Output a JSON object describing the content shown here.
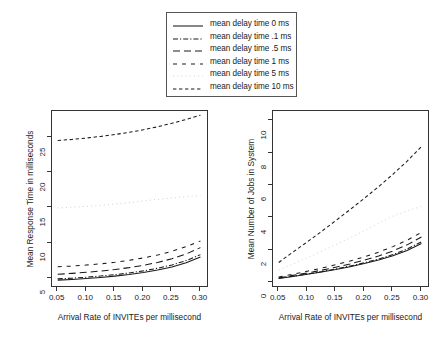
{
  "legend": {
    "position": "top-center",
    "border": "#555555",
    "entries": [
      {
        "label": "mean delay time 0 ms",
        "style": "solid",
        "dash": "none",
        "key": "legend-key-0ms"
      },
      {
        "label": "mean delay time .1 ms",
        "style": "dash-dot",
        "dash": "5,2,1.2,2",
        "key": "legend-key-0p1ms"
      },
      {
        "label": "mean delay time .5 ms",
        "style": "long-dash",
        "dash": "7,4",
        "key": "legend-key-0p5ms"
      },
      {
        "label": "mean delay time 1 ms",
        "style": "short-dash",
        "dash": "4,5",
        "key": "legend-key-1ms"
      },
      {
        "label": "mean delay time 5 ms",
        "style": "fine-dotted",
        "dash": "1,3.2",
        "key": "legend-key-5ms"
      },
      {
        "label": "mean delay time 10 ms",
        "style": "dashed",
        "dash": "3.4,2.6",
        "key": "legend-key-10ms"
      }
    ]
  },
  "chart_data": [
    {
      "id": "response-time",
      "type": "line",
      "title": "",
      "xlabel": "Arrival Rate of INVITEs per millisecond",
      "ylabel": "Mean Response Time in milliseconds",
      "xlim": [
        0.04,
        0.315
      ],
      "ylim": [
        3.6,
        28.8
      ],
      "xticks": [
        0.05,
        0.1,
        0.15,
        0.2,
        0.25,
        0.3
      ],
      "xticklabels": [
        "0.05",
        "0.10",
        "0.15",
        "0.20",
        "0.25",
        "0.30"
      ],
      "yticks": [
        5,
        10,
        15,
        20,
        25
      ],
      "yticklabels": [
        "5",
        "10",
        "15",
        "20",
        "25"
      ],
      "grid": false,
      "x": [
        0.05,
        0.075,
        0.1,
        0.125,
        0.15,
        0.175,
        0.2,
        0.225,
        0.25,
        0.275,
        0.3
      ],
      "series": [
        {
          "name": "mean delay time 0 ms",
          "style": "solid",
          "dash": "none",
          "values": [
            4.72,
            4.82,
            4.95,
            5.1,
            5.29,
            5.52,
            5.8,
            6.15,
            6.6,
            7.18,
            8.0
          ]
        },
        {
          "name": "mean delay time .1 ms",
          "style": "dash-dot",
          "dash": "5,2,1.2,2",
          "values": [
            4.9,
            5.0,
            5.14,
            5.3,
            5.5,
            5.74,
            6.04,
            6.41,
            6.88,
            7.5,
            8.35
          ]
        },
        {
          "name": "mean delay time .5 ms",
          "style": "long-dash",
          "dash": "7,4",
          "values": [
            5.55,
            5.68,
            5.83,
            6.01,
            6.23,
            6.5,
            6.83,
            7.24,
            7.76,
            8.44,
            9.35
          ]
        },
        {
          "name": "mean delay time 1 ms",
          "style": "short-dash",
          "dash": "4,5",
          "values": [
            6.62,
            6.72,
            6.86,
            7.04,
            7.26,
            7.54,
            7.88,
            8.3,
            8.83,
            9.5,
            10.3
          ]
        },
        {
          "name": "mean delay time 5 ms",
          "style": "fine-dotted",
          "dash": "1,3.2",
          "values": [
            15.0,
            15.1,
            15.22,
            15.37,
            15.55,
            15.76,
            16.0,
            16.22,
            16.42,
            16.6,
            16.78
          ]
        },
        {
          "name": "mean delay time 10 ms",
          "style": "dashed",
          "dash": "3.4,2.6",
          "values": [
            24.6,
            24.75,
            24.95,
            25.18,
            25.45,
            25.76,
            26.12,
            26.55,
            27.05,
            27.6,
            28.2
          ]
        }
      ]
    },
    {
      "id": "jobs-in-system",
      "type": "line",
      "title": "",
      "xlabel": "Arrival Rate of INVITEs per millisecond",
      "ylabel": "Mean Number of Jobs in System",
      "xlim": [
        0.04,
        0.315
      ],
      "ylim": [
        -0.35,
        10.6
      ],
      "xticks": [
        0.05,
        0.1,
        0.15,
        0.2,
        0.25,
        0.3
      ],
      "xticklabels": [
        "0.05",
        "0.10",
        "0.15",
        "0.20",
        "0.25",
        "0.30"
      ],
      "yticks": [
        0,
        2,
        4,
        6,
        8,
        10
      ],
      "yticklabels": [
        "0",
        "2",
        "4",
        "6",
        "8",
        "10"
      ],
      "grid": false,
      "x": [
        0.05,
        0.075,
        0.1,
        0.125,
        0.15,
        0.175,
        0.2,
        0.225,
        0.25,
        0.275,
        0.3
      ],
      "series": [
        {
          "name": "mean delay time 0 ms",
          "style": "solid",
          "dash": "none",
          "values": [
            0.24,
            0.36,
            0.5,
            0.64,
            0.79,
            0.97,
            1.16,
            1.38,
            1.65,
            1.97,
            2.4
          ]
        },
        {
          "name": "mean delay time .1 ms",
          "style": "dash-dot",
          "dash": "5,2,1.2,2",
          "values": [
            0.25,
            0.38,
            0.51,
            0.66,
            0.83,
            1.01,
            1.21,
            1.44,
            1.72,
            2.06,
            2.51
          ]
        },
        {
          "name": "mean delay time .5 ms",
          "style": "long-dash",
          "dash": "7,4",
          "values": [
            0.28,
            0.43,
            0.58,
            0.75,
            0.94,
            1.14,
            1.37,
            1.63,
            1.94,
            2.32,
            2.81
          ]
        },
        {
          "name": "mean delay time 1 ms",
          "style": "short-dash",
          "dash": "4,5",
          "values": [
            0.33,
            0.5,
            0.69,
            0.88,
            1.09,
            1.32,
            1.58,
            1.87,
            2.21,
            2.61,
            3.09
          ]
        },
        {
          "name": "mean delay time 5 ms",
          "style": "fine-dotted",
          "dash": "1,3.2",
          "values": [
            0.75,
            1.13,
            1.52,
            1.92,
            2.33,
            2.75,
            3.2,
            3.65,
            4.1,
            4.42,
            4.7
          ]
        },
        {
          "name": "mean delay time 10 ms",
          "style": "dashed",
          "dash": "3.4,2.6",
          "values": [
            1.23,
            1.87,
            2.5,
            3.15,
            3.82,
            4.5,
            5.2,
            5.92,
            6.68,
            7.5,
            8.4
          ]
        }
      ]
    }
  ]
}
